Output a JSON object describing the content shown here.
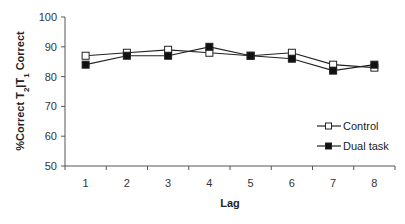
{
  "chart_data": {
    "type": "line",
    "title": "",
    "xlabel": "Lag",
    "ylabel": "%Correct T2|T1 Correct",
    "ylabel_parts": {
      "main": "%Correct T",
      "sub1": "2",
      "mid": "|T",
      "sub2": "1",
      "end": " Correct"
    },
    "categories": [
      "1",
      "2",
      "3",
      "4",
      "5",
      "6",
      "7",
      "8"
    ],
    "ylim": [
      50,
      100
    ],
    "yticks": [
      50,
      60,
      70,
      80,
      90,
      100
    ],
    "grid": false,
    "legend_position": "right, inside plot lower-right",
    "series": [
      {
        "name": "Control",
        "marker": "open-square",
        "values": [
          87,
          88,
          89,
          88,
          87,
          88,
          84,
          83
        ]
      },
      {
        "name": "Dual task",
        "marker": "filled-square",
        "values": [
          84,
          87,
          87,
          90,
          87,
          86,
          82,
          84
        ]
      }
    ]
  },
  "colors": {
    "line": "#222222",
    "axis": "#555555",
    "open_marker_fill": "#ffffff",
    "filled_marker_fill": "#111111"
  }
}
